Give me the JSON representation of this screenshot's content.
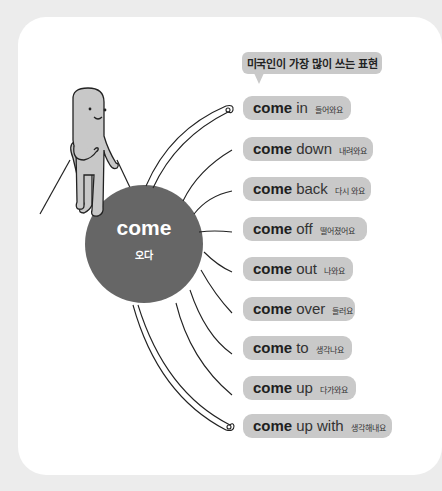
{
  "title": "미국인이 가장 많이 쓰는 표현",
  "center": {
    "word": "come",
    "meaning": "오다"
  },
  "colors": {
    "background": "#ececec",
    "card": "#ffffff",
    "pill": "#c9c9c9",
    "circle": "#666666",
    "character": "#c8c8c8",
    "line": "#222222"
  },
  "phrases": [
    {
      "verb": "come",
      "particle": "in",
      "meaning": "들어와요"
    },
    {
      "verb": "come",
      "particle": "down",
      "meaning": "내려와요"
    },
    {
      "verb": "come",
      "particle": "back",
      "meaning": "다시 와요"
    },
    {
      "verb": "come",
      "particle": "off",
      "meaning": "떨어졌어요"
    },
    {
      "verb": "come",
      "particle": "out",
      "meaning": "나와요"
    },
    {
      "verb": "come",
      "particle": "over",
      "meaning": "들러요"
    },
    {
      "verb": "come",
      "particle": "to",
      "meaning": "생각나요"
    },
    {
      "verb": "come",
      "particle": "up",
      "meaning": "다가와요"
    },
    {
      "verb": "come",
      "particle": "up with",
      "meaning": "생각해내요"
    }
  ]
}
